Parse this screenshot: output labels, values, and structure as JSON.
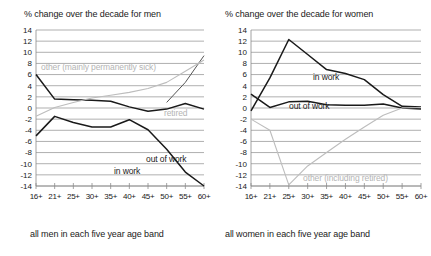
{
  "chart_data": [
    {
      "type": "line",
      "title": "% change over the decade for men",
      "xlabel": "all men in each five year age band",
      "ylabel": "",
      "categories": [
        "16+",
        "21+",
        "25+",
        "30+",
        "35+",
        "40+",
        "45+",
        "50+",
        "55+",
        "60+"
      ],
      "ylim": [
        -14,
        14
      ],
      "yticks": [
        14,
        12,
        10,
        8,
        6,
        4,
        2,
        0,
        -2,
        -4,
        -6,
        -8,
        -10,
        -12,
        -14
      ],
      "grid": true,
      "legend_position": "inline-annotations",
      "series": [
        {
          "name": "out of work",
          "style": "dark",
          "values": [
            6.0,
            1.6,
            1.5,
            1.4,
            1.2,
            0.2,
            -0.6,
            -0.2,
            0.8,
            -0.2
          ]
        },
        {
          "name": "in work",
          "style": "dark",
          "values": [
            -5.0,
            -1.5,
            -2.6,
            -3.4,
            -3.4,
            -2.1,
            -3.9,
            -7.4,
            -11.5,
            -14.0
          ]
        },
        {
          "name": "retired",
          "style": "mid",
          "values": [
            null,
            null,
            null,
            null,
            null,
            null,
            null,
            1.0,
            4.6,
            9.4
          ]
        },
        {
          "name": "other (mainly permanently sick)",
          "style": "light",
          "values": [
            -1.5,
            0.1,
            1.0,
            1.8,
            2.3,
            2.8,
            3.5,
            4.6,
            6.6,
            8.6
          ]
        }
      ],
      "annotations": [
        {
          "text": "other (mainly permanently sick)",
          "style": "light"
        },
        {
          "text": "retired",
          "style": "light"
        },
        {
          "text": "out of work",
          "style": "dark"
        },
        {
          "text": "in work",
          "style": "dark"
        }
      ]
    },
    {
      "type": "line",
      "title": "% change over the decade for women",
      "xlabel": "all women in each five year age band",
      "ylabel": "",
      "categories": [
        "16+",
        "21+",
        "25+",
        "30+",
        "35+",
        "40+",
        "45+",
        "50+",
        "55+",
        "60+"
      ],
      "ylim": [
        -14,
        14
      ],
      "yticks": [
        14,
        12,
        10,
        8,
        6,
        4,
        2,
        0,
        -2,
        -4,
        -6,
        -8,
        -10,
        -12,
        -14
      ],
      "grid": true,
      "legend_position": "inline-annotations",
      "series": [
        {
          "name": "in work",
          "style": "dark",
          "values": [
            -0.5,
            5.4,
            12.3,
            9.6,
            6.9,
            6.2,
            5.1,
            2.4,
            0.3,
            0.2
          ]
        },
        {
          "name": "out of work",
          "style": "dark",
          "values": [
            2.5,
            0.1,
            1.1,
            1.2,
            0.6,
            0.5,
            0.5,
            0.7,
            0.0,
            -0.2
          ]
        },
        {
          "name": "other (including retired)",
          "style": "light",
          "values": [
            -2.0,
            -4.0,
            -13.8,
            -10.4,
            -8.0,
            -5.6,
            -3.4,
            -1.3,
            0.0,
            0.1
          ]
        }
      ],
      "annotations": [
        {
          "text": "in work",
          "style": "dark"
        },
        {
          "text": "out of work",
          "style": "dark"
        },
        {
          "text": "other (including retired)",
          "style": "light"
        }
      ]
    }
  ],
  "left": {
    "title": "% change over the decade for men",
    "caption": "all men in each five year age band",
    "ann_other": "other (mainly permanently sick)",
    "ann_retired": "retired",
    "ann_out": "out of work",
    "ann_in": "in work",
    "yticks": [
      "14",
      "12",
      "10",
      "8",
      "6",
      "4",
      "2",
      "0",
      "-2",
      "-4",
      "-6",
      "-8",
      "-10",
      "-12",
      "-14"
    ],
    "xticks": [
      "16+",
      "21+",
      "25+",
      "30+",
      "35+",
      "40+",
      "45+",
      "50+",
      "55+",
      "60+"
    ]
  },
  "right": {
    "title": "% change over the decade for women",
    "caption": "all women in each five year age band",
    "ann_in": "in work",
    "ann_out": "out of work",
    "ann_other": "other (including retired)",
    "yticks": [
      "14",
      "12",
      "10",
      "8",
      "6",
      "4",
      "2",
      "0",
      "-2",
      "-4",
      "-6",
      "-8",
      "-10",
      "-12",
      "-14"
    ],
    "xticks": [
      "16+",
      "21+",
      "25+",
      "30+",
      "35+",
      "40+",
      "45+",
      "50+",
      "55+",
      "60+"
    ]
  },
  "colors": {
    "dark": "#1a1a1a",
    "mid": "#555555",
    "light": "#bdbdbd",
    "grid": "#8c8c8c"
  }
}
